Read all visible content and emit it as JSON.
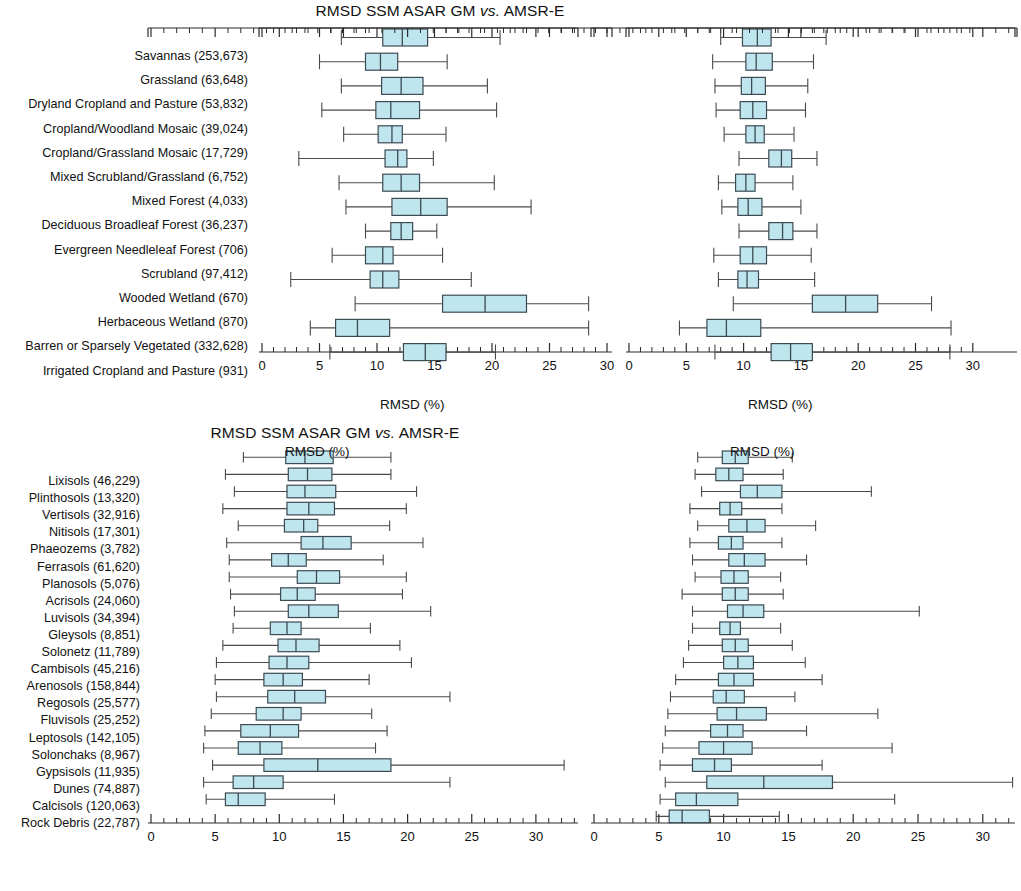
{
  "figure": {
    "axis_label": "RMSD (%)",
    "box_fill": "#bfe6ef",
    "box_stroke": "#3c4a52",
    "whisker_color": "#4a4a4a",
    "axis_color": "#2b2b2b"
  },
  "panels": [
    {
      "id": "top-left",
      "title_plain": "RMSD SSM ASAR GM ",
      "title_italic": "vs.",
      "title_tail": " AMSR-E",
      "xlabel": "RMSD (%)",
      "xlim": [
        0,
        30
      ],
      "xticks": [
        0,
        5,
        10,
        15,
        20,
        25,
        30
      ],
      "categories": [
        "Savannas (253,673)",
        "Grassland (63,648)",
        "Dryland Cropland and Pasture (53,832)",
        "Cropland/Woodland Mosaic (39,024)",
        "Cropland/Grassland Mosaic (17,729)",
        "Mixed Scrubland/Grassland (6,752)",
        "Mixed Forest (4,033)",
        "Deciduous Broadleaf Forest (36,237)",
        "Evergreen Needleleaf Forest (706)",
        "Scrubland (97,412)",
        "Wooded Wetland (670)",
        "Herbaceous Wetland (870)",
        "Barren or Sparsely Vegetated (332,628)",
        "Irrigated Cropland and Pasture (931)"
      ],
      "boxes": [
        {
          "low": 6.9,
          "q1": 10.5,
          "median": 12.2,
          "q3": 14.4,
          "high": 20.7
        },
        {
          "low": 5.0,
          "q1": 9.0,
          "median": 10.3,
          "q3": 11.8,
          "high": 16.1
        },
        {
          "low": 6.9,
          "q1": 10.4,
          "median": 12.1,
          "q3": 14.0,
          "high": 19.6
        },
        {
          "low": 5.2,
          "q1": 9.9,
          "median": 11.2,
          "q3": 13.7,
          "high": 20.4
        },
        {
          "low": 7.1,
          "q1": 10.1,
          "median": 11.3,
          "q3": 12.2,
          "high": 16.0
        },
        {
          "low": 3.2,
          "q1": 10.7,
          "median": 11.8,
          "q3": 12.6,
          "high": 14.9
        },
        {
          "low": 6.7,
          "q1": 10.5,
          "median": 12.1,
          "q3": 13.7,
          "high": 20.2
        },
        {
          "low": 7.3,
          "q1": 11.3,
          "median": 13.8,
          "q3": 16.1,
          "high": 23.4
        },
        {
          "low": 9.0,
          "q1": 11.2,
          "median": 12.1,
          "q3": 13.1,
          "high": 15.2
        },
        {
          "low": 6.1,
          "q1": 9.0,
          "median": 10.5,
          "q3": 11.4,
          "high": 15.7
        },
        {
          "low": 2.5,
          "q1": 9.4,
          "median": 10.5,
          "q3": 11.9,
          "high": 18.2
        },
        {
          "low": 8.1,
          "q1": 15.7,
          "median": 19.4,
          "q3": 23.0,
          "high": 28.4
        },
        {
          "low": 4.2,
          "q1": 6.4,
          "median": 8.3,
          "q3": 11.1,
          "high": 28.4
        },
        {
          "low": 5.9,
          "q1": 12.3,
          "median": 14.2,
          "q3": 16.0,
          "high": 20.3
        }
      ]
    },
    {
      "id": "top-right",
      "title_plain": "RMSD SSM ASAR GM ",
      "title_italic": "vs.",
      "title_tail": " GLDAS",
      "xlabel": "RMSD (%)",
      "xlim": [
        0,
        30
      ],
      "xticks": [
        0,
        5,
        10,
        15,
        20,
        25,
        30
      ],
      "categories": [
        "Savannas (253,673)",
        "Grassland (63,648)",
        "Dryland Cropland and Pasture (53,832)",
        "Cropland/Woodland Mosaic (39,024)",
        "Cropland/Grassland Mosaic (17,729)",
        "Mixed Scrubland/Grassland (6,752)",
        "Mixed Forest (4,033)",
        "Deciduous Broadleaf Forest (36,237)",
        "Evergreen Needleleaf Forest (706)",
        "Scrubland (97,412)",
        "Wooded Wetland (670)",
        "Herbaceous Wetland (870)",
        "Barren or Sparsely Vegetated (332,628)",
        "Irrigated Cropland and Pasture (931)"
      ],
      "boxes": [
        {
          "low": 8.0,
          "q1": 9.9,
          "median": 11.2,
          "q3": 12.4,
          "high": 17.2
        },
        {
          "low": 7.3,
          "q1": 10.2,
          "median": 11.1,
          "q3": 12.5,
          "high": 16.1
        },
        {
          "low": 7.5,
          "q1": 9.8,
          "median": 10.7,
          "q3": 11.9,
          "high": 15.6
        },
        {
          "low": 7.6,
          "q1": 9.7,
          "median": 10.8,
          "q3": 12.0,
          "high": 15.4
        },
        {
          "low": 8.3,
          "q1": 10.2,
          "median": 11.0,
          "q3": 11.8,
          "high": 14.4
        },
        {
          "low": 9.6,
          "q1": 12.2,
          "median": 13.3,
          "q3": 14.2,
          "high": 16.4
        },
        {
          "low": 7.8,
          "q1": 9.3,
          "median": 10.2,
          "q3": 11.0,
          "high": 14.3
        },
        {
          "low": 8.1,
          "q1": 9.5,
          "median": 10.4,
          "q3": 11.6,
          "high": 15.0
        },
        {
          "low": 9.6,
          "q1": 12.2,
          "median": 13.4,
          "q3": 14.3,
          "high": 16.4
        },
        {
          "low": 7.4,
          "q1": 9.7,
          "median": 10.8,
          "q3": 12.0,
          "high": 15.9
        },
        {
          "low": 7.8,
          "q1": 9.5,
          "median": 10.3,
          "q3": 11.3,
          "high": 16.2
        },
        {
          "low": 9.1,
          "q1": 16.0,
          "median": 18.9,
          "q3": 21.7,
          "high": 26.4
        },
        {
          "low": 4.4,
          "q1": 6.8,
          "median": 8.5,
          "q3": 11.5,
          "high": 28.1
        },
        {
          "low": 7.5,
          "q1": 12.4,
          "median": 14.1,
          "q3": 16.0,
          "high": 28.0
        }
      ]
    },
    {
      "id": "bottom-left",
      "title_plain": "RMSD SSM ASAR GM ",
      "title_italic": "vs.",
      "title_tail": " AMSR-E",
      "xlabel": "RMSD (%)",
      "xlim": [
        0,
        33
      ],
      "xticks": [
        0,
        5,
        10,
        15,
        20,
        25,
        30
      ],
      "categories": [
        "Lixisols (46,229)",
        "Plinthosols (13,320)",
        "Vertisols (32,916)",
        "Nitisols (17,301)",
        "Phaeozems (3,782)",
        "Ferrasols (61,620)",
        "Planosols (5,076)",
        "Acrisols (24,060)",
        "Luvisols (34,394)",
        "Gleysols (8,851)",
        "Solonetz (11,789)",
        "Cambisols (45,216)",
        "Arenosols (158,844)",
        "Regosols (25,577)",
        "Fluvisols (25,252)",
        "Leptosols (142,105)",
        "Solonchaks (8,967)",
        "Gypsisols (11,935)",
        "Dunes (74,887)",
        "Calcisols (120,063)",
        "Rock Debris (22,787)"
      ],
      "boxes": [
        {
          "low": 7.2,
          "q1": 10.5,
          "median": 12.0,
          "q3": 14.2,
          "high": 18.7
        },
        {
          "low": 5.8,
          "q1": 10.7,
          "median": 12.2,
          "q3": 14.1,
          "high": 18.7
        },
        {
          "low": 6.5,
          "q1": 10.6,
          "median": 12.0,
          "q3": 14.4,
          "high": 20.7
        },
        {
          "low": 5.6,
          "q1": 10.6,
          "median": 12.3,
          "q3": 14.3,
          "high": 19.9
        },
        {
          "low": 6.8,
          "q1": 10.4,
          "median": 11.9,
          "q3": 13.0,
          "high": 18.6
        },
        {
          "low": 5.9,
          "q1": 11.7,
          "median": 13.4,
          "q3": 15.6,
          "high": 21.2
        },
        {
          "low": 6.1,
          "q1": 9.4,
          "median": 10.7,
          "q3": 12.1,
          "high": 18.1
        },
        {
          "low": 6.1,
          "q1": 11.4,
          "median": 12.9,
          "q3": 14.7,
          "high": 19.9
        },
        {
          "low": 6.2,
          "q1": 10.1,
          "median": 11.4,
          "q3": 12.8,
          "high": 19.6
        },
        {
          "low": 6.5,
          "q1": 10.7,
          "median": 12.3,
          "q3": 14.6,
          "high": 21.8
        },
        {
          "low": 6.4,
          "q1": 9.3,
          "median": 10.6,
          "q3": 11.7,
          "high": 17.1
        },
        {
          "low": 5.6,
          "q1": 9.9,
          "median": 11.3,
          "q3": 13.1,
          "high": 19.4
        },
        {
          "low": 5.1,
          "q1": 9.2,
          "median": 10.6,
          "q3": 12.3,
          "high": 20.3
        },
        {
          "low": 5.0,
          "q1": 8.8,
          "median": 10.3,
          "q3": 11.8,
          "high": 17.0
        },
        {
          "low": 5.1,
          "q1": 9.1,
          "median": 11.2,
          "q3": 13.6,
          "high": 23.3
        },
        {
          "low": 4.7,
          "q1": 8.2,
          "median": 10.3,
          "q3": 11.7,
          "high": 17.2
        },
        {
          "low": 4.2,
          "q1": 7.0,
          "median": 9.3,
          "q3": 11.5,
          "high": 18.4
        },
        {
          "low": 4.1,
          "q1": 6.8,
          "median": 8.5,
          "q3": 10.2,
          "high": 17.5
        },
        {
          "low": 4.8,
          "q1": 8.8,
          "median": 13.0,
          "q3": 18.7,
          "high": 32.2
        },
        {
          "low": 4.1,
          "q1": 6.4,
          "median": 8.0,
          "q3": 10.3,
          "high": 23.3
        },
        {
          "low": 4.3,
          "q1": 5.8,
          "median": 6.8,
          "q3": 8.9,
          "high": 14.3
        }
      ]
    },
    {
      "id": "bottom-right",
      "title_plain": "RMSD SSM ASAR GM ",
      "title_italic": "vs.",
      "title_tail": " GLDAS",
      "xlabel": "RMSD (%)",
      "xlim": [
        0,
        33
      ],
      "xticks": [
        0,
        5,
        10,
        15,
        20,
        25,
        30
      ],
      "categories": [
        "Lixisols (46,229)",
        "Plinthosols (13,320)",
        "Vertisols (32,916)",
        "Nitisols (17,301)",
        "Phaeozems (3,782)",
        "Ferrasols (61,620)",
        "Planosols (5,076)",
        "Acrisols (24,060)",
        "Luvisols (34,394)",
        "Gleysols (8,851)",
        "Solonetz (11,789)",
        "Cambisols (45,216)",
        "Arenosols (158,844)",
        "Regosols (25,577)",
        "Fluvisols (25,252)",
        "Leptosols (142,105)",
        "Solonchaks (8,967)",
        "Gypsisols (11,935)",
        "Dunes (74,887)",
        "Calcisols (120,063)",
        "Rock Debris (22,787)"
      ],
      "boxes": [
        {
          "low": 8.0,
          "q1": 9.9,
          "median": 10.9,
          "q3": 11.9,
          "high": 15.3
        },
        {
          "low": 7.8,
          "q1": 9.4,
          "median": 10.4,
          "q3": 11.5,
          "high": 14.6
        },
        {
          "low": 8.3,
          "q1": 11.3,
          "median": 12.6,
          "q3": 14.5,
          "high": 21.4
        },
        {
          "low": 7.4,
          "q1": 9.7,
          "median": 10.5,
          "q3": 11.4,
          "high": 14.5
        },
        {
          "low": 8.0,
          "q1": 10.4,
          "median": 11.8,
          "q3": 13.2,
          "high": 17.1
        },
        {
          "low": 7.4,
          "q1": 9.6,
          "median": 10.6,
          "q3": 11.5,
          "high": 14.5
        },
        {
          "low": 7.6,
          "q1": 10.4,
          "median": 11.6,
          "q3": 13.2,
          "high": 16.4
        },
        {
          "low": 7.8,
          "q1": 9.8,
          "median": 10.8,
          "q3": 11.9,
          "high": 14.4
        },
        {
          "low": 6.8,
          "q1": 9.9,
          "median": 10.9,
          "q3": 11.9,
          "high": 14.6
        },
        {
          "low": 7.6,
          "q1": 10.3,
          "median": 11.5,
          "q3": 13.1,
          "high": 25.1
        },
        {
          "low": 7.6,
          "q1": 9.7,
          "median": 10.5,
          "q3": 11.3,
          "high": 14.4
        },
        {
          "low": 7.3,
          "q1": 9.9,
          "median": 10.9,
          "q3": 11.9,
          "high": 15.3
        },
        {
          "low": 6.9,
          "q1": 10.0,
          "median": 11.1,
          "q3": 12.3,
          "high": 16.3
        },
        {
          "low": 6.3,
          "q1": 9.6,
          "median": 10.8,
          "q3": 12.3,
          "high": 17.6
        },
        {
          "low": 5.9,
          "q1": 9.2,
          "median": 10.2,
          "q3": 11.6,
          "high": 15.5
        },
        {
          "low": 5.7,
          "q1": 9.5,
          "median": 11.0,
          "q3": 13.3,
          "high": 21.9
        },
        {
          "low": 5.5,
          "q1": 9.0,
          "median": 10.3,
          "q3": 11.5,
          "high": 16.4
        },
        {
          "low": 5.3,
          "q1": 8.1,
          "median": 10.0,
          "q3": 12.2,
          "high": 23.0
        },
        {
          "low": 5.1,
          "q1": 7.6,
          "median": 9.3,
          "q3": 10.6,
          "high": 17.6
        },
        {
          "low": 5.5,
          "q1": 8.7,
          "median": 13.1,
          "q3": 18.4,
          "high": 32.3
        },
        {
          "low": 5.1,
          "q1": 6.3,
          "median": 7.9,
          "q3": 11.1,
          "high": 23.2
        },
        {
          "low": 4.8,
          "q1": 5.8,
          "median": 6.8,
          "q3": 8.9,
          "high": 14.3
        }
      ]
    }
  ]
}
